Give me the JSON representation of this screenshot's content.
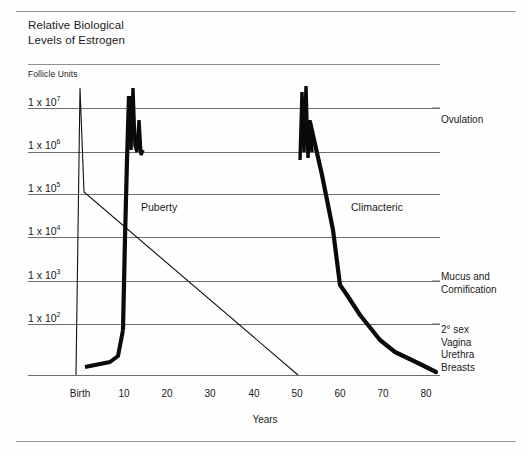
{
  "figure": {
    "title": "Relative Biological\nLevels of Estrogen",
    "units_label": "Follicle Units",
    "xaxis_title": "Years"
  },
  "annotations": {
    "puberty": "Puberty",
    "climacteric": "Climacteric",
    "ovulation": "Ovulation",
    "mucus": "Mucus and\nCornification",
    "secondary_sex": "2° sex\nVagina\nUrethra\nBreasts"
  },
  "chart_data": {
    "type": "line",
    "title": "Relative Biological Levels of Estrogen",
    "xlabel": "Years",
    "ylabel": "Follicle Units",
    "yscale": "log",
    "ylim": [
      100,
      100000000
    ],
    "xlim": [
      -2,
      82
    ],
    "grid": true,
    "legend_position": "none",
    "ytick_labels": [
      "1 x 10⁷",
      "1 x 10⁶",
      "1 x 10⁵",
      "1 x 10⁴",
      "1 x 10³",
      "1 x 10²"
    ],
    "ytick_values": [
      10000000,
      1000000,
      100000,
      10000,
      1000,
      100
    ],
    "xtick_labels": [
      "Birth",
      "10",
      "20",
      "30",
      "40",
      "50",
      "60",
      "70",
      "80"
    ],
    "xtick_values": [
      0,
      10,
      20,
      30,
      40,
      50,
      60,
      70,
      80
    ],
    "series": [
      {
        "name": "Follicle units (thin declining line)",
        "style": "thin",
        "points": [
          {
            "x": 0,
            "y": 30
          },
          {
            "x": 0,
            "y": 20000000
          },
          {
            "x": 2,
            "y": 100000
          },
          {
            "x": 53,
            "y": 30
          }
        ]
      },
      {
        "name": "Estrogen level (heavy curve)",
        "style": "thick",
        "points": [
          {
            "x": 2,
            "y": 25
          },
          {
            "x": 7,
            "y": 30
          },
          {
            "x": 9,
            "y": 60
          },
          {
            "x": 10,
            "y": 2500
          },
          {
            "x": 10.5,
            "y": 300000
          },
          {
            "x": 11,
            "y": 20000000
          },
          {
            "x": 11.5,
            "y": 1500000
          },
          {
            "x": 12,
            "y": 12000000
          },
          {
            "x": 12.5,
            "y": 800000
          },
          {
            "x": 49,
            "y": 800000
          },
          {
            "x": 49.5,
            "y": 20000000
          },
          {
            "x": 50,
            "y": 1200000
          },
          {
            "x": 50.5,
            "y": 9000000
          },
          {
            "x": 53,
            "y": 600000
          },
          {
            "x": 58,
            "y": 60000
          },
          {
            "x": 60,
            "y": 1200
          },
          {
            "x": 62,
            "y": 600
          },
          {
            "x": 70,
            "y": 150
          },
          {
            "x": 80,
            "y": 60
          }
        ]
      }
    ],
    "cycle_spikes": {
      "description": "Dense monthly ovulatory oscillation between menarche and menopause",
      "puberty_spike_x": 11,
      "climacteric_spike_x": 50,
      "spike_peak": 20000000
    },
    "annotations": [
      {
        "text": "Puberty",
        "x": 14,
        "y": 40000
      },
      {
        "text": "Climacteric",
        "x": 54,
        "y": 40000
      },
      {
        "text": "Ovulation",
        "x": 82,
        "y": 2500000
      },
      {
        "text": "Mucus and Cornification",
        "x": 82,
        "y": 1200
      },
      {
        "text": "2° sex Vagina Urethra Breasts",
        "x": 82,
        "y": 120
      }
    ]
  },
  "axes_geometry": {
    "ytick_y_px": [
      108,
      152,
      194,
      237,
      281,
      324
    ],
    "baseline_y_px": 375,
    "xtick_x_px": [
      78,
      122,
      165,
      208,
      252,
      295,
      338,
      381,
      424
    ],
    "plot_left_px": 28,
    "plot_right_px": 440
  }
}
